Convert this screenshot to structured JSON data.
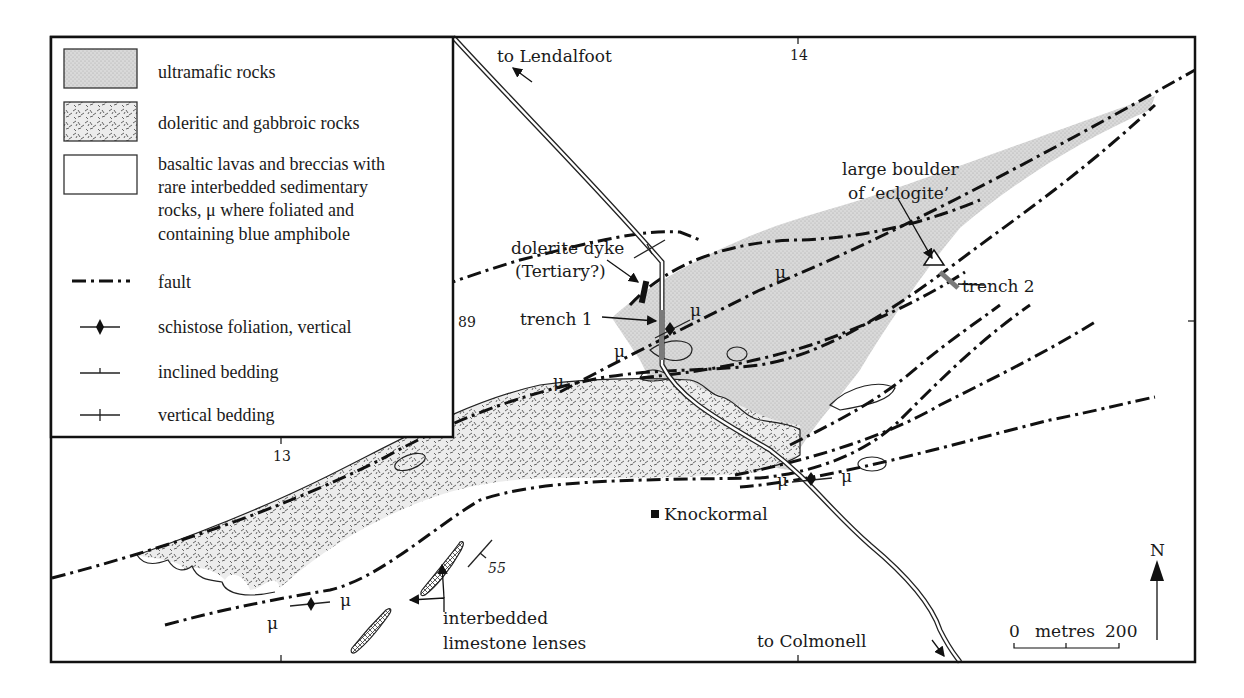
{
  "map": {
    "type": "geological sketch map",
    "grid_labels": {
      "easting_top": "14",
      "easting_bottom": "13",
      "northing": "89"
    },
    "legend": {
      "items": [
        {
          "symbol": "ultramafic-fill",
          "label": "ultramafic rocks"
        },
        {
          "symbol": "doleritic-fill",
          "label": "doleritic and gabbroic rocks"
        },
        {
          "symbol": "basalt-fill",
          "label_lines": [
            "basaltic lavas and breccias with",
            "rare interbedded sedimentary",
            "rocks, μ where foliated and",
            "containing blue amphibole"
          ]
        },
        {
          "symbol": "fault-line",
          "label": "fault"
        },
        {
          "symbol": "foliation-diamond",
          "label": "schistose foliation, vertical"
        },
        {
          "symbol": "inclined-bedding",
          "label": "inclined bedding"
        },
        {
          "symbol": "vertical-bedding",
          "label": "vertical bedding"
        }
      ]
    },
    "annotations": {
      "to_lendalfoot": "to Lendalfoot",
      "to_colmonell": "to Colmonell",
      "dyke_line1": "dolerite dyke",
      "dyke_line2": "(Tertiary?)",
      "trench1": "trench 1",
      "trench2": "trench 2",
      "boulder_line1": "large boulder",
      "boulder_line2": "of ‘eclogite’",
      "knockormal": "Knockormal",
      "limestone_line1": "interbedded",
      "limestone_line2": "limestone lenses",
      "dip_value": "55",
      "mu": "μ"
    },
    "scale_bar": {
      "start": "0",
      "unit": "metres",
      "end": "200"
    },
    "north_arrow": "N",
    "colors": {
      "ultramafic": "#d6d6d6",
      "dolerite_base": "#e4e4e4",
      "trench": "#7a7a7a",
      "ink": "#111111"
    }
  }
}
